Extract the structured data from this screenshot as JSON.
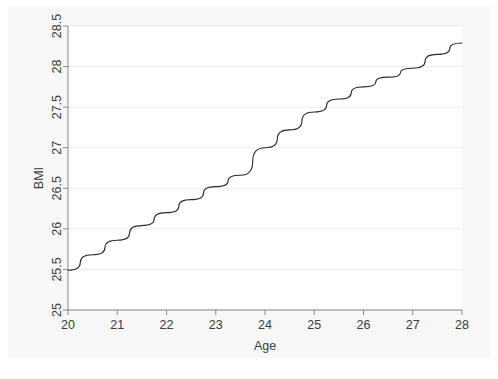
{
  "figure": {
    "background_color": "#ffffff",
    "plot_background_color": "#ffffff",
    "graph_region_color": "#f7f7f7",
    "axis_color": "#8a8a8a",
    "grid_color": "#ececec",
    "line_color": "#2b2b2b",
    "tick_label_color": "#3c3c3c"
  },
  "chart_data": {
    "type": "line",
    "title": "",
    "subtitle": "",
    "xlabel": "Age",
    "ylabel": "BMI",
    "xlim": [
      20,
      28
    ],
    "ylim": [
      25,
      28.5
    ],
    "xticks": [
      20,
      21,
      22,
      23,
      24,
      25,
      26,
      27,
      28
    ],
    "xticklabels": [
      "20",
      "21",
      "22",
      "23",
      "24",
      "25",
      "26",
      "27",
      "28"
    ],
    "yticks": [
      25,
      25.5,
      26,
      26.5,
      27,
      27.5,
      28,
      28.5
    ],
    "yticklabels": [
      "25",
      "25.5",
      "26",
      "26.5",
      "27",
      "27.5",
      "28",
      "28.5"
    ],
    "grid": "horizontal",
    "legend": null,
    "annotations": [],
    "series": [
      {
        "name": "BMI",
        "color": "#2b2b2b",
        "line_width": 1,
        "markers": false,
        "x": [
          20,
          20.5,
          21,
          21.5,
          22,
          22.5,
          23,
          23.5,
          24,
          24.5,
          25,
          25.5,
          26,
          26.5,
          27,
          27.5,
          28
        ],
        "y": [
          25.49,
          25.68,
          25.86,
          26.04,
          26.2,
          26.36,
          26.52,
          26.66,
          27.0,
          27.22,
          27.44,
          27.6,
          27.75,
          27.87,
          27.98,
          28.15,
          28.29
        ]
      }
    ]
  }
}
